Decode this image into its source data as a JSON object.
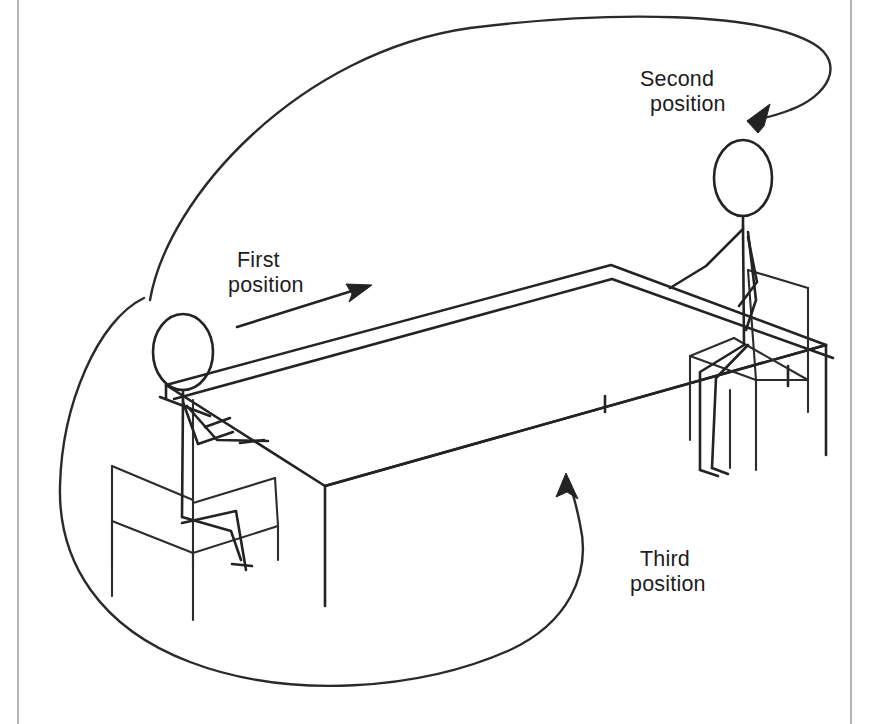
{
  "figure": {
    "background_color": "#ffffff",
    "ink_color": "#232323",
    "frame_color": "#b4b4b4"
  },
  "annotations": {
    "first": {
      "line1": "First",
      "line2": "position",
      "arrow_type": "straight-arrow-right",
      "icon": "arrow-right-icon"
    },
    "second": {
      "line1": "Second",
      "line2": "position",
      "arrow_type": "curved-arrow-down-right",
      "icon": "curved-arrow-icon"
    },
    "third": {
      "line1": "Third",
      "line2": "position",
      "arrow_type": "curved-arrow-up",
      "icon": "curved-arrow-icon"
    }
  },
  "scene": {
    "table": "rectangular-conference-table",
    "figures": [
      {
        "name": "seated-person-left",
        "side": "near-left",
        "seat": "chair-left"
      },
      {
        "name": "seated-person-right",
        "side": "far-right",
        "seat": "chair-right"
      }
    ]
  }
}
